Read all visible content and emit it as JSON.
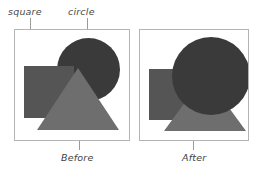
{
  "figure": {
    "background": "#ffffff",
    "width": 258,
    "height": 172
  },
  "callouts": [
    {
      "id": "square",
      "label": "square",
      "target_panel": "Before",
      "target_shape": "square"
    },
    {
      "id": "circle",
      "label": "circle",
      "target_panel": "Before",
      "target_shape": "circle"
    }
  ],
  "panels": [
    {
      "id": "before",
      "caption": "Before",
      "border_color": "#b4b4b4",
      "background": "#ffffff",
      "shapes": [
        {
          "name": "circle",
          "color": "#3a3a3a",
          "z_order": 1
        },
        {
          "name": "square",
          "color": "#555555",
          "z_order": 2
        },
        {
          "name": "triangle",
          "color": "#6e6e6e",
          "z_order": 3
        }
      ]
    },
    {
      "id": "after",
      "caption": "After",
      "border_color": "#b4b4b4",
      "background": "#ffffff",
      "shapes": [
        {
          "name": "square",
          "color": "#555555",
          "z_order": 1
        },
        {
          "name": "triangle",
          "color": "#6e6e6e",
          "z_order": 2
        },
        {
          "name": "circle",
          "color": "#3a3a3a",
          "z_order": 3
        }
      ]
    }
  ],
  "colors": {
    "circle_fill": "#3a3a3a",
    "square_fill": "#555555",
    "triangle_fill": "#6e6e6e",
    "panel_border": "#b4b4b4",
    "leader_line": "#9a9a9a",
    "label_text": "#4a4a4a",
    "caption_text": "#3f3f3f"
  }
}
